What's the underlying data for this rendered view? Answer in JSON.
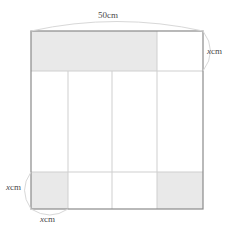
{
  "figure": {
    "type": "geometry-diagram",
    "colors": {
      "shade_fill": "#e9e9e9",
      "outer_stroke": "#8a8a8a",
      "inner_stroke": "#cfcfcf",
      "guide_stroke": "#d8d8d8",
      "label_color": "#4a4a4a",
      "background": "#ffffff"
    },
    "frame": {
      "left": 31,
      "top": 31,
      "right": 203,
      "bottom": 209
    },
    "grid": {
      "vertical_lines": [
        68,
        112,
        157
      ],
      "horizontal_lines": [
        71,
        172
      ]
    },
    "shaded_regions": [
      {
        "name": "top-band",
        "x": 31,
        "y": 31,
        "width": 126,
        "height": 40
      },
      {
        "name": "bottom-left-cell",
        "x": 31,
        "y": 172,
        "width": 37,
        "height": 37
      },
      {
        "name": "bottom-right-band",
        "x": 157,
        "y": 172,
        "width": 46,
        "height": 37
      }
    ]
  },
  "labels": {
    "top": {
      "value": "50",
      "unit": "cm",
      "full": "50cm"
    },
    "right": {
      "variable": "x",
      "unit": "cm",
      "full": "xcm"
    },
    "bottom_left": {
      "variable": "x",
      "unit": "cm",
      "full": "xcm"
    },
    "bottom": {
      "variable": "x",
      "unit": "cm",
      "full": "xcm"
    }
  },
  "dimension_arcs": {
    "top_arc": "spans full width above the square",
    "right_arc": "spans top band height at right side",
    "bottom_left_arc": "spans bottom band height at left side",
    "bottom_arc": "spans bottom-left cell width below the square"
  }
}
